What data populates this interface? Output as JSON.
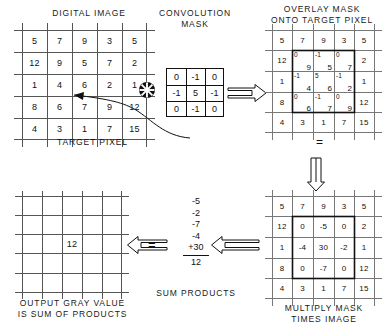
{
  "diagram": {
    "operator_symbol": "convolution-asterisk",
    "equals_symbol": "="
  },
  "digital_image": {
    "caption": "DIGITAL IMAGE",
    "rows": [
      [
        "5",
        "7",
        "9",
        "3",
        "5"
      ],
      [
        "12",
        "9",
        "5",
        "7",
        "2"
      ],
      [
        "1",
        "4",
        "6",
        "2",
        "1"
      ],
      [
        "8",
        "6",
        "7",
        "9",
        "12"
      ],
      [
        "4",
        "3",
        "1",
        "7",
        "15"
      ]
    ],
    "target_pixel": {
      "label": "TARGET PIXEL",
      "value": "6",
      "row": 2,
      "col": 2
    }
  },
  "convolution_mask": {
    "caption": "CONVOLUTION\nMASK",
    "rows": [
      [
        "0",
        "-1",
        "0"
      ],
      [
        "-1",
        "5",
        "-1"
      ],
      [
        "0",
        "-1",
        "0"
      ]
    ]
  },
  "overlay": {
    "caption": "OVERLAY MASK\nONTO TARGET PIXEL",
    "base_rows": [
      [
        "5",
        "7",
        "9",
        "3",
        "5"
      ],
      [
        "12",
        "",
        "",
        "",
        "2"
      ],
      [
        "1",
        "",
        "",
        "",
        "1"
      ],
      [
        "8",
        "",
        "",
        "",
        "12"
      ],
      [
        "4",
        "3",
        "1",
        "7",
        "15"
      ]
    ],
    "overlay_cells": [
      [
        {
          "mask": "0",
          "image": "9"
        },
        {
          "mask": "-1",
          "image": "5"
        },
        {
          "mask": "0",
          "image": "7"
        }
      ],
      [
        {
          "mask": "-1",
          "image": "4"
        },
        {
          "mask": "5",
          "image": "6"
        },
        {
          "mask": "-1",
          "image": "2"
        }
      ],
      [
        {
          "mask": "0",
          "image": "6"
        },
        {
          "mask": "-1",
          "image": "7"
        },
        {
          "mask": "0",
          "image": "9"
        }
      ]
    ]
  },
  "multiply": {
    "caption": "MULTIPLY MASK\nTIMES IMAGE",
    "rows": [
      [
        "5",
        "7",
        "9",
        "3",
        "5"
      ],
      [
        "12",
        "0",
        "-5",
        "0",
        "2"
      ],
      [
        "1",
        "-4",
        "30",
        "-2",
        "1"
      ],
      [
        "8",
        "0",
        "-7",
        "0",
        "12"
      ],
      [
        "4",
        "3",
        "1",
        "7",
        "15"
      ]
    ],
    "highlight_products": [
      [
        "0",
        "-5",
        "0"
      ],
      [
        "-4",
        "30",
        "-2"
      ],
      [
        "0",
        "-7",
        "0"
      ]
    ]
  },
  "sum_products": {
    "caption": "SUM PRODUCTS",
    "terms": [
      "-5",
      "-2",
      "-7",
      "-4",
      "+30"
    ],
    "total": "12"
  },
  "output": {
    "caption": "OUTPUT GRAY VALUE\nIS SUM OF PRODUCTS",
    "value": "12",
    "row": 2,
    "col": 2
  },
  "arrows": {
    "mask_to_overlay": "arrow-right",
    "overlay_to_multiply": "arrow-down",
    "multiply_to_sum": "arrow-left",
    "sum_to_output": "arrow-left"
  },
  "colors": {
    "ink": "#111111",
    "grid": "#555555",
    "background": "#ffffff"
  }
}
